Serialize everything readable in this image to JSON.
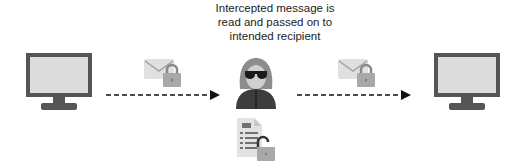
{
  "caption": {
    "line1": "Intercepted message is",
    "line2": "read and passed on to",
    "line3": "intended recipient"
  },
  "nodes": {
    "sender": {
      "icon": "computer-monitor-icon"
    },
    "attacker": {
      "icon": "hooded-hacker-icon"
    },
    "recipient": {
      "icon": "computer-monitor-icon"
    }
  },
  "messages": {
    "left": {
      "icon": "envelope-locked-icon"
    },
    "right": {
      "icon": "envelope-locked-icon"
    },
    "exposed": {
      "icon": "document-unlocked-icon"
    }
  },
  "colors": {
    "monitor_frame": "#555555",
    "monitor_screen": "#dcdcdc",
    "envelope": "#e0e0e0",
    "lock": "#a8a8a8",
    "hood_dark": "#3d3d3d",
    "hair": "#8c8c8c",
    "face": "#cfcfcf",
    "arrow": "#111111"
  }
}
